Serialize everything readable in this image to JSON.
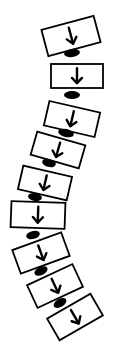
{
  "diagram": {
    "title": "",
    "stroke_color": "#000000",
    "fill_color": "#ffffff",
    "vertebrae": [
      {
        "cx": 71,
        "cy": 36,
        "w": 54,
        "h": 27,
        "rot": -15
      },
      {
        "cx": 77,
        "cy": 76,
        "w": 52,
        "h": 24,
        "rot": 0
      },
      {
        "cx": 72,
        "cy": 119,
        "w": 52,
        "h": 25,
        "rot": 13
      },
      {
        "cx": 58,
        "cy": 150,
        "w": 50,
        "h": 24,
        "rot": 16
      },
      {
        "cx": 45,
        "cy": 183,
        "w": 50,
        "h": 24,
        "rot": 13
      },
      {
        "cx": 38,
        "cy": 215,
        "w": 54,
        "h": 26,
        "rot": 2
      },
      {
        "cx": 41,
        "cy": 253,
        "w": 52,
        "h": 25,
        "rot": -20
      },
      {
        "cx": 55,
        "cy": 286,
        "w": 50,
        "h": 25,
        "rot": -25
      },
      {
        "cx": 75,
        "cy": 317,
        "w": 50,
        "h": 25,
        "rot": -30
      }
    ],
    "discs": [
      {
        "cx": 72,
        "cy": 53,
        "rx": 8,
        "ry": 4,
        "rot": -8
      },
      {
        "cx": 72,
        "cy": 95,
        "rx": 8,
        "ry": 4,
        "rot": 0
      },
      {
        "cx": 66,
        "cy": 133,
        "rx": 8,
        "ry": 4,
        "rot": 12
      },
      {
        "cx": 49,
        "cy": 163,
        "rx": 7,
        "ry": 4,
        "rot": 15
      },
      {
        "cx": 35,
        "cy": 197,
        "rx": 7,
        "ry": 4,
        "rot": 8
      },
      {
        "cx": 33,
        "cy": 235,
        "rx": 7,
        "ry": 4,
        "rot": -15
      },
      {
        "cx": 41,
        "cy": 271,
        "rx": 7,
        "ry": 4,
        "rot": -25
      },
      {
        "cx": 60,
        "cy": 303,
        "rx": 7,
        "ry": 4,
        "rot": -30
      }
    ],
    "arrow_icon": "down-arrow-icon"
  }
}
